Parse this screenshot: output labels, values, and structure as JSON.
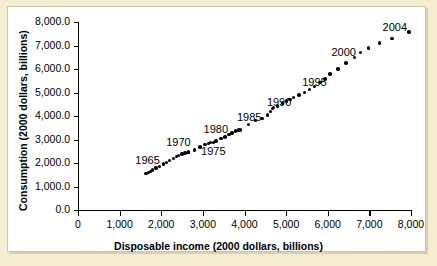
{
  "chart_data": {
    "type": "scatter",
    "title": "",
    "xlabel": "Disposable income (2000 dollars, billions)",
    "ylabel": "Consumption (2000 dollars, billions)",
    "xlim": [
      0,
      8000
    ],
    "ylim": [
      0,
      8000
    ],
    "grid": false,
    "legend": "none",
    "xticks": [
      "0",
      "1,000",
      "2,000",
      "3,000",
      "4,000",
      "5,000",
      "6,000",
      "7,000",
      "8,000"
    ],
    "xtick_values": [
      0,
      1000,
      2000,
      3000,
      4000,
      5000,
      6000,
      7000,
      8000
    ],
    "yticks": [
      "0.0",
      "1,000.0",
      "2,000.0",
      "3,000.0",
      "4,000.0",
      "5,000.0",
      "6,000.0",
      "7,000.0",
      "8,000.0"
    ],
    "ytick_values": [
      0,
      1000,
      2000,
      3000,
      4000,
      5000,
      6000,
      7000,
      8000
    ],
    "marker": "filled-circle",
    "marker_color": "#000000",
    "points": [
      {
        "x": 1630,
        "y": 1550
      },
      {
        "x": 1690,
        "y": 1600
      },
      {
        "x": 1740,
        "y": 1650
      },
      {
        "x": 1790,
        "y": 1700
      },
      {
        "x": 1870,
        "y": 1780
      },
      {
        "x": 1960,
        "y": 1860
      },
      {
        "x": 2050,
        "y": 1950
      },
      {
        "x": 2120,
        "y": 2030
      },
      {
        "x": 2200,
        "y": 2110
      },
      {
        "x": 2290,
        "y": 2190
      },
      {
        "x": 2360,
        "y": 2270
      },
      {
        "x": 2420,
        "y": 2330
      },
      {
        "x": 2500,
        "y": 2390
      },
      {
        "x": 2570,
        "y": 2430
      },
      {
        "x": 2640,
        "y": 2450
      },
      {
        "x": 2660,
        "y": 2460
      },
      {
        "x": 2800,
        "y": 2560
      },
      {
        "x": 2930,
        "y": 2680
      },
      {
        "x": 3050,
        "y": 2780
      },
      {
        "x": 3130,
        "y": 2840
      },
      {
        "x": 3190,
        "y": 2860
      },
      {
        "x": 3250,
        "y": 2880
      },
      {
        "x": 3320,
        "y": 2940
      },
      {
        "x": 3440,
        "y": 3030
      },
      {
        "x": 3530,
        "y": 3110
      },
      {
        "x": 3630,
        "y": 3200
      },
      {
        "x": 3700,
        "y": 3280
      },
      {
        "x": 3790,
        "y": 3360
      },
      {
        "x": 3830,
        "y": 3390
      },
      {
        "x": 3860,
        "y": 3400
      },
      {
        "x": 3890,
        "y": 3410
      },
      {
        "x": 4090,
        "y": 3640
      },
      {
        "x": 4260,
        "y": 3800
      },
      {
        "x": 4420,
        "y": 3900
      },
      {
        "x": 4550,
        "y": 4050
      },
      {
        "x": 4620,
        "y": 4190
      },
      {
        "x": 4680,
        "y": 4320
      },
      {
        "x": 4700,
        "y": 4360
      },
      {
        "x": 4790,
        "y": 4420
      },
      {
        "x": 4920,
        "y": 4550
      },
      {
        "x": 5010,
        "y": 4630
      },
      {
        "x": 5090,
        "y": 4690
      },
      {
        "x": 5170,
        "y": 4780
      },
      {
        "x": 5310,
        "y": 4900
      },
      {
        "x": 5440,
        "y": 5000
      },
      {
        "x": 5560,
        "y": 5120
      },
      {
        "x": 5680,
        "y": 5250
      },
      {
        "x": 5810,
        "y": 5420
      },
      {
        "x": 5930,
        "y": 5580
      },
      {
        "x": 6050,
        "y": 5790
      },
      {
        "x": 6250,
        "y": 6000
      },
      {
        "x": 6440,
        "y": 6250
      },
      {
        "x": 6640,
        "y": 6500
      },
      {
        "x": 6790,
        "y": 6700
      },
      {
        "x": 6980,
        "y": 6890
      },
      {
        "x": 7250,
        "y": 7100
      },
      {
        "x": 7540,
        "y": 7300
      },
      {
        "x": 7950,
        "y": 7570
      }
    ],
    "annotations": [
      {
        "label": "1965",
        "x": 1690,
        "y": 2090
      },
      {
        "label": "1970",
        "x": 2430,
        "y": 2860
      },
      {
        "label": "1975",
        "x": 3270,
        "y": 2450
      },
      {
        "label": "1980",
        "x": 3330,
        "y": 3400
      },
      {
        "label": "1985",
        "x": 4130,
        "y": 3900
      },
      {
        "label": "1990",
        "x": 4850,
        "y": 4550
      },
      {
        "label": "1995",
        "x": 5700,
        "y": 5400
      },
      {
        "label": "2000",
        "x": 6400,
        "y": 6670
      },
      {
        "label": "2004",
        "x": 7630,
        "y": 7740
      }
    ]
  }
}
